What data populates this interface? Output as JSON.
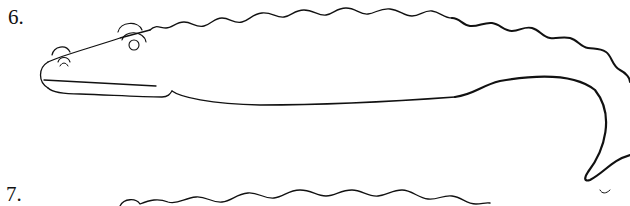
{
  "steps": [
    {
      "number": "6.",
      "description": "Crocodile outline with wavy back, eyes, nostril, mouth line and curled tail"
    },
    {
      "number": "7.",
      "description": "Next step drawing (partially visible, wavy back line)"
    }
  ],
  "colors": {
    "stroke": "#111111",
    "background": "#ffffff"
  }
}
